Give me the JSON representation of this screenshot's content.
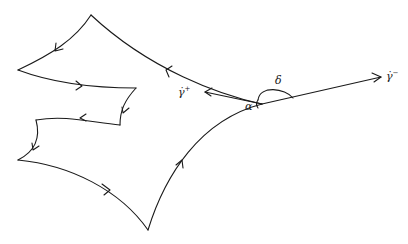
{
  "figure": {
    "stroke_color": "#1a1a1a",
    "background": "#ffffff"
  },
  "labels": {
    "gamma_plus": "γ̇",
    "gamma_plus_sup": "+",
    "gamma_minus": "γ̇",
    "gamma_minus_sup": "−",
    "alpha": "α",
    "delta": "δ"
  }
}
